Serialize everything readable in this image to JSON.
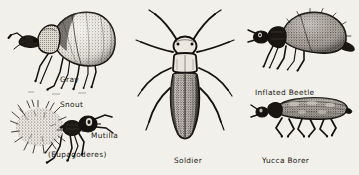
{
  "plate": {
    "kind": "natural-history-illustration-plate",
    "medium": "pen-and-ink stipple engraving",
    "background_color": "#f2f0ea",
    "ink_color": "#1a1713",
    "width": 359,
    "height": 175,
    "figure_count": 5
  },
  "figures": [
    {
      "id": "gray-snout-beetle",
      "label_lines": [
        "Gray",
        "Snout",
        "Beetle",
        "(Eupagoderes)"
      ],
      "label_text": "Gray Snout Beetle (Eupagoderes)",
      "genus": "Eupagoderes",
      "common_name": "Gray Snout Beetle",
      "view": "lateral",
      "facing": "left",
      "position": "top-left",
      "label_position": "right-of-figure"
    },
    {
      "id": "mutilla",
      "label_lines": [
        "Mutilla"
      ],
      "label_text": "Mutilla",
      "genus": "Mutilla",
      "common_name": "Velvet Ant",
      "view": "lateral",
      "facing": "right",
      "position": "bottom-left",
      "label_position": "right-of-figure"
    },
    {
      "id": "soldier-beetle",
      "label_lines": [
        "Soldier",
        "Beetle(Lytta)"
      ],
      "label_text": "Soldier Beetle (Lytta)",
      "genus": "Lytta",
      "common_name": "Soldier Beetle",
      "view": "dorsal",
      "facing": "up",
      "position": "center",
      "label_position": "below-figure"
    },
    {
      "id": "inflated-beetle",
      "label_lines": [
        "Inflated Beetle"
      ],
      "label_text": "Inflated Beetle",
      "common_name": "Inflated Beetle",
      "view": "lateral",
      "facing": "left",
      "position": "top-right",
      "label_position": "below-figure"
    },
    {
      "id": "yucca-borer",
      "label_lines": [
        "Yucca Borer"
      ],
      "label_text": "Yucca Borer",
      "common_name": "Yucca Borer",
      "view": "lateral",
      "facing": "left",
      "position": "bottom-right",
      "label_position": "below-figure"
    }
  ]
}
